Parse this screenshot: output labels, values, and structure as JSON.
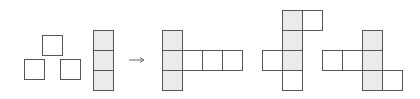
{
  "diagram": {
    "colors": {
      "stroke": "#555555",
      "shaded_fill": "#ebebeb",
      "empty_fill": "#ffffff",
      "arrow": "#666666"
    },
    "cell_size": 20,
    "arrow_glyph": "→",
    "given": {
      "loose_squares": [
        {
          "x": 42,
          "y": 35,
          "shaded": false
        },
        {
          "x": 24,
          "y": 59,
          "shaded": false
        },
        {
          "x": 60,
          "y": 59,
          "shaded": false
        }
      ],
      "column": [
        {
          "x": 93,
          "y": 30,
          "shaded": true
        },
        {
          "x": 93,
          "y": 50,
          "shaded": true
        },
        {
          "x": 93,
          "y": 70,
          "shaded": true
        }
      ]
    },
    "options": [
      {
        "name": "net-1",
        "cells": [
          {
            "x": 162,
            "y": 30,
            "shaded": true
          },
          {
            "x": 162,
            "y": 50,
            "shaded": true
          },
          {
            "x": 162,
            "y": 70,
            "shaded": true
          },
          {
            "x": 182,
            "y": 50,
            "shaded": false
          },
          {
            "x": 202,
            "y": 50,
            "shaded": false
          },
          {
            "x": 222,
            "y": 50,
            "shaded": false
          }
        ]
      },
      {
        "name": "net-2",
        "cells": [
          {
            "x": 282,
            "y": 10,
            "shaded": true
          },
          {
            "x": 282,
            "y": 30,
            "shaded": true
          },
          {
            "x": 282,
            "y": 50,
            "shaded": true
          },
          {
            "x": 282,
            "y": 70,
            "shaded": false
          },
          {
            "x": 302,
            "y": 10,
            "shaded": false
          },
          {
            "x": 262,
            "y": 50,
            "shaded": false
          }
        ]
      },
      {
        "name": "net-3",
        "cells": [
          {
            "x": 322,
            "y": 50,
            "shaded": false
          },
          {
            "x": 342,
            "y": 50,
            "shaded": false
          },
          {
            "x": 362,
            "y": 30,
            "shaded": true
          },
          {
            "x": 362,
            "y": 50,
            "shaded": true
          },
          {
            "x": 362,
            "y": 70,
            "shaded": true
          },
          {
            "x": 382,
            "y": 70,
            "shaded": false
          }
        ]
      }
    ]
  }
}
